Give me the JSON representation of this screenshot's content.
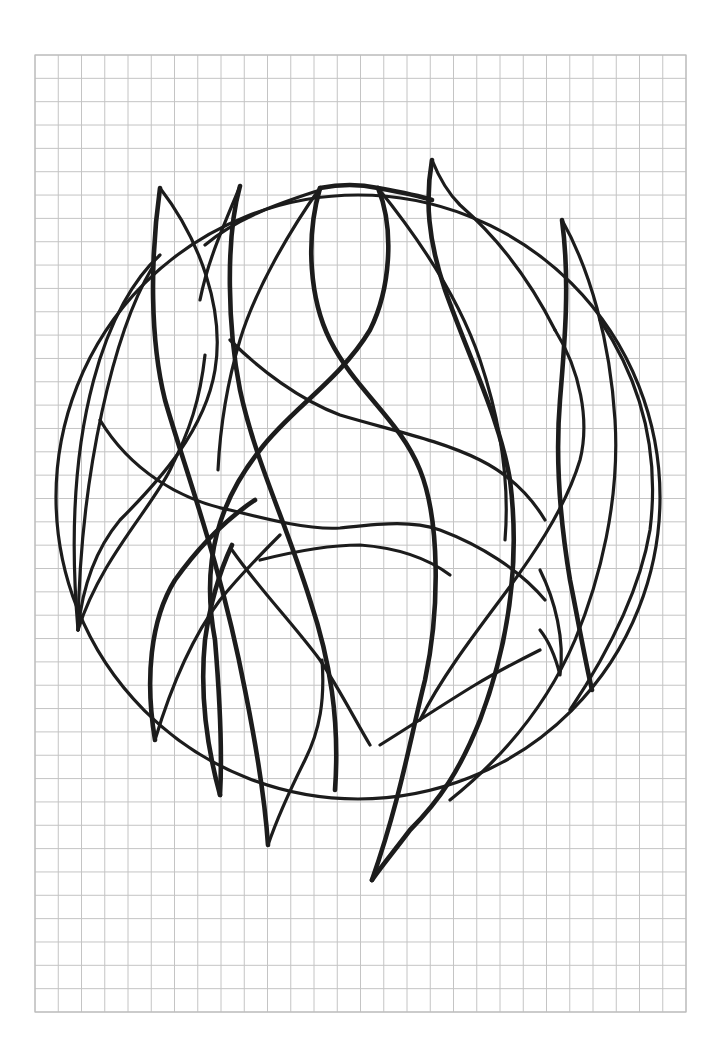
{
  "sheet": {
    "type": "graph-paper-drawing",
    "background_color": "#ffffff",
    "grid": {
      "left": 35,
      "top": 55,
      "right": 686,
      "bottom": 1012,
      "columns": 28,
      "rows": 41,
      "line_color": "#c4c4c4"
    },
    "ink_color": "#1c1c1c"
  },
  "drawing": {
    "subject": "circle with overlapping flame-like strokes",
    "circle": {
      "cx": 358,
      "cy": 500,
      "r": 300
    },
    "stroke_count": 22
  }
}
